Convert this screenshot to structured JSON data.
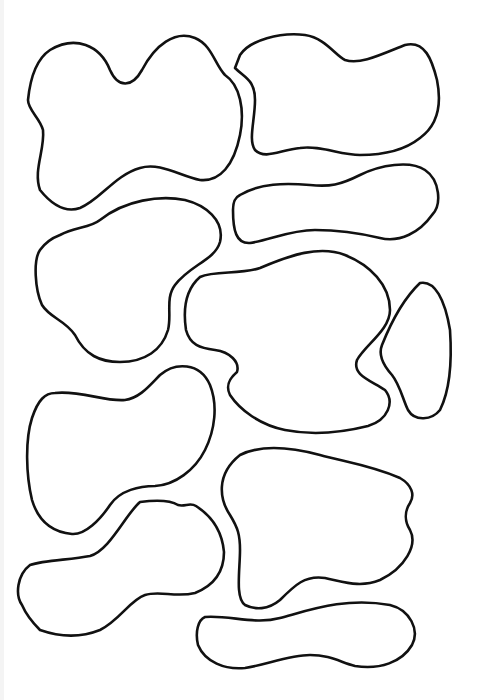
{
  "image": {
    "width": 477,
    "height": 700,
    "background": "#ffffff",
    "stroke_color": "#111111",
    "description": "Line drawing of eleven irregular closed blob outlines arranged in a grid-like layout"
  },
  "shapes": [
    {
      "id": "blob-1",
      "position": "top-left",
      "d": "M 50 50 C 75 35, 100 45, 110 70 C 118 88, 132 88, 142 70 C 155 45, 175 30, 195 38 C 212 45, 215 65, 225 75 C 240 85, 245 110, 240 135 C 234 165, 220 182, 200 180 C 180 176, 160 162, 140 168 C 115 175, 100 200, 80 208 C 62 214, 48 200, 40 190 C 33 170, 45 150, 43 130 C 40 118, 28 110, 28 100 C 30 80, 35 60, 50 50 Z"
    },
    {
      "id": "blob-2",
      "position": "top-right",
      "d": "M 240 55 C 250 40, 280 32, 305 35 C 325 38, 335 55, 345 60 C 360 65, 380 55, 405 45 C 425 40, 432 60, 437 80 C 442 105, 438 125, 420 138 C 405 150, 385 155, 360 155 C 340 155, 320 145, 300 148 C 280 150, 265 160, 255 150 C 248 140, 255 120, 255 100 C 255 80, 245 78, 235 68 Z"
    },
    {
      "id": "blob-3",
      "position": "upper-right-capsule",
      "d": "M 240 195 C 260 183, 285 183, 310 185 C 330 187, 340 185, 360 175 C 380 165, 410 160, 425 170 C 440 180, 442 205, 432 215 C 420 232, 400 243, 380 238 C 355 232, 335 230, 315 230 C 290 230, 270 240, 250 243 C 236 244, 233 230, 233 210 C 233 200, 236 197, 240 195 Z"
    },
    {
      "id": "blob-4",
      "position": "middle-left",
      "d": "M 60 235 C 75 227, 90 228, 100 220 C 125 200, 160 195, 185 200 C 205 205, 225 220, 220 242 C 215 260, 190 265, 175 285 C 165 298, 172 315, 168 330 C 162 350, 145 362, 120 362 C 100 362, 85 355, 75 335 C 65 320, 50 318, 42 305 C 35 290, 33 260, 40 250 C 45 243, 52 238, 60 235 Z"
    },
    {
      "id": "blob-5",
      "position": "center",
      "d": "M 200 277 C 215 270, 240 275, 260 268 C 290 255, 320 245, 345 255 C 370 265, 390 285, 390 310 C 390 330, 365 345, 357 360 C 352 375, 370 380, 385 390 C 395 402, 388 420, 368 426 C 340 433, 310 435, 285 430 C 260 425, 240 410, 230 395 C 225 385, 230 378, 237 372 C 240 362, 230 352, 215 350 C 200 348, 190 345, 186 330 C 183 310, 185 290, 200 277 Z"
    },
    {
      "id": "blob-6",
      "position": "right-triangle",
      "d": "M 420 283 C 435 280, 445 300, 450 330 C 452 360, 450 390, 440 410 C 432 420, 415 422, 408 410 C 403 400, 400 385, 392 375 C 383 365, 378 355, 382 345 C 390 325, 402 300, 420 283 Z"
    },
    {
      "id": "blob-7",
      "position": "lower-left",
      "d": "M 55 393 C 80 390, 105 402, 125 400 C 140 398, 150 385, 160 375 C 175 362, 200 362, 210 385 C 218 405, 215 430, 205 450 C 195 470, 175 485, 155 486 C 140 486, 120 490, 110 505 C 100 520, 85 535, 72 534 C 50 532, 38 520, 32 500 C 26 475, 25 440, 32 418 C 38 400, 45 393, 55 393 Z"
    },
    {
      "id": "blob-8",
      "position": "lower-right",
      "d": "M 240 455 C 260 445, 290 447, 320 455 C 345 462, 370 465, 400 478 C 412 485, 415 495, 410 503 C 404 512, 405 522, 410 530 C 418 545, 405 568, 380 580 C 360 588, 345 582, 325 578 C 305 575, 295 585, 280 600 C 268 610, 255 610, 245 605 C 235 598, 240 570, 240 550 C 240 535, 238 528, 230 515 C 220 500, 215 475, 240 455 Z"
    },
    {
      "id": "blob-9",
      "position": "bottom-left",
      "d": "M 30 565 C 45 560, 70 560, 90 556 C 110 550, 125 515, 140 502 C 155 500, 170 500, 178 505 C 185 507, 190 502, 196 506 C 210 515, 222 530, 224 552 C 224 570, 215 585, 195 593 C 175 598, 160 590, 145 595 C 130 600, 120 620, 100 630 C 80 638, 60 637, 40 630 C 30 620, 25 612, 22 605 C 15 595, 17 575, 30 565 Z"
    },
    {
      "id": "blob-10",
      "position": "bottom-capsule",
      "d": "M 205 617 C 230 615, 255 625, 280 618 C 310 610, 345 597, 390 605 C 410 610, 420 630, 412 645 C 402 662, 380 670, 355 666 C 340 662, 330 655, 310 655 C 290 655, 265 665, 245 668 C 225 670, 205 662, 198 645 C 195 632, 198 620, 205 617 Z"
    },
    {
      "id": "blob-6b",
      "position": "left-edge-notch",
      "d": "M 0 0"
    }
  ]
}
